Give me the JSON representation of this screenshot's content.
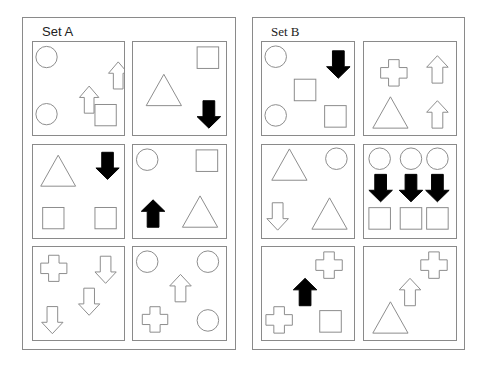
{
  "sets": [
    {
      "title": "Set A",
      "panels": [
        {
          "shapes": [
            {
              "type": "circle",
              "x": 14,
              "y": 15,
              "r": 11,
              "fill": "none"
            },
            {
              "type": "arrow-up",
              "x": 78,
              "y": 20,
              "w": 20,
              "h": 28,
              "fill": "none"
            },
            {
              "type": "arrow-up",
              "x": 48,
              "y": 45,
              "w": 20,
              "h": 28,
              "fill": "none"
            },
            {
              "type": "circle",
              "x": 14,
              "y": 74,
              "r": 11,
              "fill": "none"
            },
            {
              "type": "square",
              "x": 64,
              "y": 64,
              "s": 22,
              "fill": "none"
            }
          ]
        },
        {
          "shapes": [
            {
              "type": "square",
              "x": 65,
              "y": 5,
              "s": 22,
              "fill": "none"
            },
            {
              "type": "triangle",
              "x": 13,
              "y": 33,
              "w": 36,
              "h": 32,
              "fill": "none"
            },
            {
              "type": "arrow-down",
              "x": 65,
              "y": 60,
              "w": 24,
              "h": 28,
              "fill": "black"
            }
          ]
        },
        {
          "shapes": [
            {
              "type": "triangle",
              "x": 8,
              "y": 10,
              "w": 36,
              "h": 32,
              "fill": "none"
            },
            {
              "type": "arrow-down",
              "x": 65,
              "y": 7,
              "w": 24,
              "h": 28,
              "fill": "black"
            },
            {
              "type": "square",
              "x": 10,
              "y": 64,
              "s": 22,
              "fill": "none"
            },
            {
              "type": "square",
              "x": 64,
              "y": 64,
              "s": 22,
              "fill": "none"
            }
          ]
        },
        {
          "shapes": [
            {
              "type": "circle",
              "x": 14,
              "y": 15,
              "r": 11,
              "fill": "none"
            },
            {
              "type": "square",
              "x": 64,
              "y": 5,
              "s": 22,
              "fill": "none"
            },
            {
              "type": "arrow-up",
              "x": 8,
              "y": 56,
              "w": 24,
              "h": 28,
              "fill": "black"
            },
            {
              "type": "triangle",
              "x": 50,
              "y": 52,
              "w": 36,
              "h": 32,
              "fill": "none"
            }
          ]
        },
        {
          "shapes": [
            {
              "type": "cross",
              "x": 8,
              "y": 8,
              "s": 27,
              "fill": "none"
            },
            {
              "type": "arrow-down",
              "x": 64,
              "y": 9,
              "w": 22,
              "h": 28,
              "fill": "none"
            },
            {
              "type": "arrow-down",
              "x": 47,
              "y": 42,
              "w": 22,
              "h": 28,
              "fill": "none"
            },
            {
              "type": "arrow-down",
              "x": 9,
              "y": 61,
              "w": 22,
              "h": 28,
              "fill": "none"
            }
          ]
        },
        {
          "shapes": [
            {
              "type": "circle",
              "x": 14,
              "y": 15,
              "r": 11,
              "fill": "none"
            },
            {
              "type": "circle",
              "x": 76,
              "y": 15,
              "r": 11,
              "fill": "none"
            },
            {
              "type": "arrow-up",
              "x": 37,
              "y": 28,
              "w": 22,
              "h": 28,
              "fill": "none"
            },
            {
              "type": "cross",
              "x": 9,
              "y": 61,
              "s": 26,
              "fill": "none"
            },
            {
              "type": "circle",
              "x": 76,
              "y": 75,
              "r": 11,
              "fill": "none"
            }
          ]
        }
      ]
    },
    {
      "title": "Set B",
      "panels": [
        {
          "shapes": [
            {
              "type": "circle",
              "x": 14,
              "y": 15,
              "r": 11,
              "fill": "none"
            },
            {
              "type": "arrow-down",
              "x": 66,
              "y": 9,
              "w": 24,
              "h": 28,
              "fill": "black"
            },
            {
              "type": "square",
              "x": 33,
              "y": 38,
              "s": 22,
              "fill": "none"
            },
            {
              "type": "circle",
              "x": 14,
              "y": 75,
              "r": 11,
              "fill": "none"
            },
            {
              "type": "square",
              "x": 64,
              "y": 65,
              "s": 22,
              "fill": "none"
            }
          ]
        },
        {
          "shapes": [
            {
              "type": "cross",
              "x": 17,
              "y": 18,
              "s": 27,
              "fill": "none"
            },
            {
              "type": "arrow-up",
              "x": 64,
              "y": 14,
              "w": 22,
              "h": 28,
              "fill": "none"
            },
            {
              "type": "triangle",
              "x": 9,
              "y": 56,
              "w": 36,
              "h": 32,
              "fill": "none"
            },
            {
              "type": "arrow-up",
              "x": 64,
              "y": 60,
              "w": 22,
              "h": 28,
              "fill": "none"
            }
          ]
        },
        {
          "shapes": [
            {
              "type": "triangle",
              "x": 10,
              "y": 4,
              "w": 36,
              "h": 32,
              "fill": "none"
            },
            {
              "type": "circle",
              "x": 76,
              "y": 14,
              "r": 11,
              "fill": "none"
            },
            {
              "type": "arrow-down",
              "x": 5,
              "y": 59,
              "w": 22,
              "h": 28,
              "fill": "none"
            },
            {
              "type": "triangle",
              "x": 51,
              "y": 54,
              "w": 36,
              "h": 32,
              "fill": "none"
            }
          ]
        },
        {
          "shapes": [
            {
              "type": "circle",
              "x": 16,
              "y": 14,
              "r": 11,
              "fill": "none"
            },
            {
              "type": "circle",
              "x": 48,
              "y": 14,
              "r": 11,
              "fill": "none"
            },
            {
              "type": "circle",
              "x": 75,
              "y": 14,
              "r": 11,
              "fill": "none"
            },
            {
              "type": "arrow-down",
              "x": 5,
              "y": 30,
              "w": 24,
              "h": 28,
              "fill": "black"
            },
            {
              "type": "arrow-down",
              "x": 36,
              "y": 30,
              "w": 24,
              "h": 28,
              "fill": "black"
            },
            {
              "type": "arrow-down",
              "x": 63,
              "y": 30,
              "w": 24,
              "h": 28,
              "fill": "black"
            },
            {
              "type": "square",
              "x": 5,
              "y": 64,
              "s": 22,
              "fill": "none"
            },
            {
              "type": "square",
              "x": 37,
              "y": 64,
              "s": 22,
              "fill": "none"
            },
            {
              "type": "square",
              "x": 64,
              "y": 64,
              "s": 22,
              "fill": "none"
            }
          ]
        },
        {
          "shapes": [
            {
              "type": "cross",
              "x": 55,
              "y": 5,
              "s": 27,
              "fill": "none"
            },
            {
              "type": "arrow-up",
              "x": 32,
              "y": 32,
              "w": 24,
              "h": 28,
              "fill": "black"
            },
            {
              "type": "cross",
              "x": 4,
              "y": 61,
              "s": 27,
              "fill": "none"
            },
            {
              "type": "square",
              "x": 59,
              "y": 65,
              "s": 22,
              "fill": "none"
            }
          ]
        },
        {
          "shapes": [
            {
              "type": "cross",
              "x": 58,
              "y": 5,
              "s": 27,
              "fill": "none"
            },
            {
              "type": "arrow-up",
              "x": 36,
              "y": 32,
              "w": 22,
              "h": 28,
              "fill": "none"
            },
            {
              "type": "triangle",
              "x": 9,
              "y": 56,
              "w": 36,
              "h": 32,
              "fill": "none"
            }
          ]
        }
      ]
    }
  ]
}
